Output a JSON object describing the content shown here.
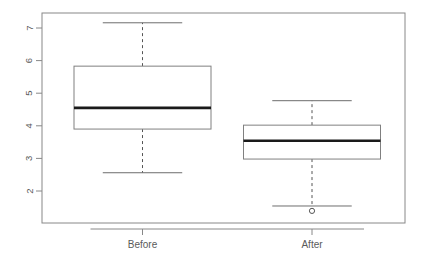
{
  "chart_data": {
    "type": "box",
    "title": "",
    "xlabel": "",
    "ylabel": "",
    "categories": [
      "Before",
      "After"
    ],
    "ylim": [
      1.2,
      7.45
    ],
    "yticks": [
      2,
      3,
      4,
      5,
      6,
      7
    ],
    "ytick_labels": [
      "2",
      "3",
      "4",
      "5",
      "6",
      "7"
    ],
    "grid": false,
    "legend": "none",
    "box_fill": "#ffffff",
    "box_stroke": "#808080",
    "median_color": "#1a1a1a",
    "whisker_style": "dashed",
    "outlier_marker": "open-circle",
    "frame": true,
    "boxes": [
      {
        "name": "Before",
        "lower_whisker": 2.56,
        "q1": 3.9,
        "median": 4.55,
        "q3": 5.83,
        "upper_whisker": 7.16,
        "outliers": []
      },
      {
        "name": "After",
        "lower_whisker": 1.54,
        "q1": 2.98,
        "median": 3.54,
        "q3": 4.02,
        "upper_whisker": 4.77,
        "outliers": [
          1.39
        ]
      }
    ]
  }
}
